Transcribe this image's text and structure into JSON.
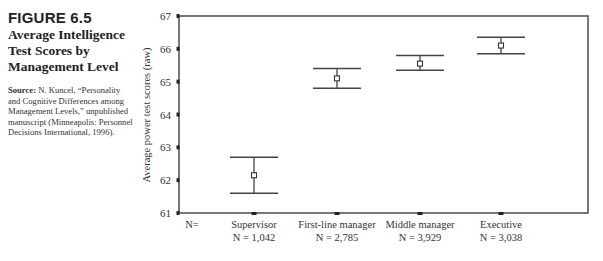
{
  "caption": {
    "figure_number": "FIGURE 6.5",
    "title": "Average Intelligence Test Scores by Management Level",
    "source_label": "Source:",
    "source_text": "N. Kuncel, “Personality and Cognitive Differences among Management Levels,” unpublished manuscript (Minneapolis: Personnel Decisions International, 1996)."
  },
  "chart_data": {
    "type": "errorbar",
    "title": "Average Intelligence Test Scores by Management Level",
    "xlabel": "",
    "ylabel": "Average power test scores (raw)",
    "ylim": [
      61,
      67
    ],
    "yticks": [
      61,
      62,
      63,
      64,
      65,
      66,
      67
    ],
    "grid": false,
    "legend": null,
    "n_label": "N=",
    "categories": [
      "Supervisor",
      "First-line manager",
      "Middle manager",
      "Executive"
    ],
    "n_labels": [
      "N = 1,042",
      "N = 2,785",
      "N = 3,929",
      "N = 3,038"
    ],
    "n_values": [
      1042,
      2785,
      3929,
      3038
    ],
    "means": [
      62.15,
      65.1,
      65.55,
      66.1
    ],
    "upper": [
      62.7,
      65.4,
      65.8,
      66.35
    ],
    "lower": [
      61.6,
      64.8,
      65.35,
      65.85
    ]
  }
}
